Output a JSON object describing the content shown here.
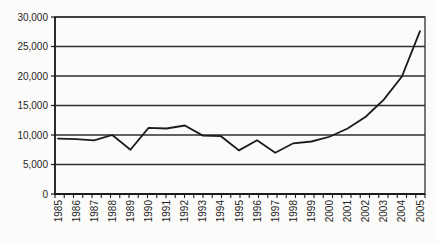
{
  "chart_data": {
    "type": "line",
    "title": "",
    "subtitle": "",
    "xlabel": "",
    "ylabel": "",
    "categories": [
      "1985",
      "1986",
      "1987",
      "1988",
      "1989",
      "1990",
      "1991",
      "1992",
      "1993",
      "1994",
      "1995",
      "1996",
      "1997",
      "1998",
      "1999",
      "2000",
      "2001",
      "2002",
      "2003",
      "2004",
      "2005"
    ],
    "series": [
      {
        "name": "value",
        "values": [
          9400,
          9300,
          9100,
          10000,
          7500,
          11200,
          11100,
          11600,
          9900,
          9800,
          7400,
          9100,
          7000,
          8600,
          8900,
          9700,
          11100,
          13100,
          16000,
          19900,
          27600
        ]
      }
    ],
    "ylim": [
      0,
      30000
    ],
    "ytick_interval": 5000,
    "ytick_labels": [
      "0",
      "5,000",
      "10,000",
      "15,000",
      "20,000",
      "25,000",
      "30,000"
    ],
    "grid": true,
    "legend": false,
    "x_label_rotation_deg": 90
  },
  "colors": {
    "background": "#fbfbf9",
    "plot_background": "#fbfbf9",
    "line": "#1b1b1b",
    "grid": "#2e2e2e",
    "axis": "#1b1b1b",
    "text": "#1f1f1f"
  }
}
